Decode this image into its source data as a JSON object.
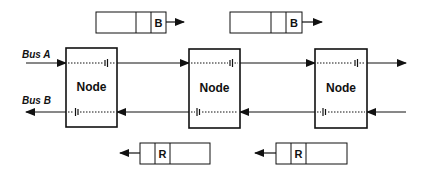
{
  "diagram": {
    "buses": [
      {
        "id": "busA",
        "label": "Bus A",
        "direction": "left-to-right"
      },
      {
        "id": "busB",
        "label": "Bus B",
        "direction": "right-to-left"
      }
    ],
    "nodes": [
      {
        "label": "Node"
      },
      {
        "label": "Node"
      },
      {
        "label": "Node"
      }
    ],
    "packets_top": [
      {
        "label": "B",
        "direction": "right"
      },
      {
        "label": "B",
        "direction": "right"
      }
    ],
    "packets_bottom": [
      {
        "label": "R",
        "direction": "left"
      },
      {
        "label": "R",
        "direction": "left"
      }
    ],
    "colors": {
      "line": "#111111",
      "background": "#ffffff"
    }
  }
}
